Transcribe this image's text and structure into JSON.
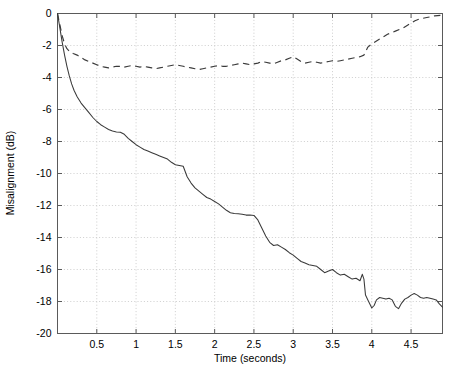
{
  "chart_data": {
    "type": "line",
    "title": "",
    "xlabel": "Time (seconds)",
    "ylabel": "Misalignment (dB)",
    "xlim": [
      0,
      4.9
    ],
    "ylim": [
      -20,
      0
    ],
    "grid": true,
    "legend": "none",
    "xticks": [
      0.5,
      1,
      1.5,
      2,
      2.5,
      3,
      3.5,
      4,
      4.5
    ],
    "xtick_labels": [
      "0.5",
      "1",
      "1.5",
      "2",
      "2.5",
      "3",
      "3.5",
      "4",
      "4.5"
    ],
    "yticks": [
      0,
      -2,
      -4,
      -6,
      -8,
      -10,
      -12,
      -14,
      -16,
      -18,
      -20
    ],
    "ytick_labels": [
      "0",
      "-2",
      "-4",
      "-6",
      "-8",
      "-10",
      "-12",
      "-14",
      "-16",
      "-18",
      "-20"
    ],
    "series": [
      {
        "name": "solid-curve",
        "style": "solid",
        "color": "#3a3a3a",
        "x": [
          0.0,
          0.03,
          0.06,
          0.09,
          0.12,
          0.15,
          0.18,
          0.21,
          0.25,
          0.3,
          0.35,
          0.4,
          0.45,
          0.5,
          0.55,
          0.6,
          0.65,
          0.7,
          0.75,
          0.8,
          0.85,
          0.9,
          0.95,
          1.0,
          1.05,
          1.1,
          1.15,
          1.2,
          1.25,
          1.3,
          1.35,
          1.4,
          1.45,
          1.5,
          1.55,
          1.6,
          1.65,
          1.7,
          1.75,
          1.8,
          1.85,
          1.9,
          1.95,
          2.0,
          2.05,
          2.1,
          2.15,
          2.2,
          2.25,
          2.3,
          2.35,
          2.4,
          2.45,
          2.5,
          2.55,
          2.6,
          2.65,
          2.7,
          2.75,
          2.8,
          2.85,
          2.9,
          2.95,
          3.0,
          3.05,
          3.1,
          3.15,
          3.2,
          3.25,
          3.3,
          3.35,
          3.4,
          3.45,
          3.5,
          3.55,
          3.6,
          3.65,
          3.7,
          3.75,
          3.8,
          3.85,
          3.88,
          3.9,
          3.92,
          3.95,
          3.98,
          4.0,
          4.03,
          4.06,
          4.1,
          4.14,
          4.18,
          4.22,
          4.26,
          4.3,
          4.34,
          4.38,
          4.42,
          4.46,
          4.5,
          4.54,
          4.58,
          4.62,
          4.66,
          4.7,
          4.74,
          4.78,
          4.82,
          4.86,
          4.9
        ],
        "y": [
          0.0,
          -0.9,
          -1.8,
          -2.6,
          -3.3,
          -3.9,
          -4.4,
          -4.8,
          -5.2,
          -5.6,
          -5.9,
          -6.2,
          -6.5,
          -6.75,
          -6.95,
          -7.1,
          -7.25,
          -7.35,
          -7.4,
          -7.42,
          -7.55,
          -7.8,
          -8.0,
          -8.2,
          -8.35,
          -8.5,
          -8.6,
          -8.7,
          -8.8,
          -8.9,
          -9.0,
          -9.1,
          -9.3,
          -9.45,
          -9.5,
          -9.55,
          -10.2,
          -10.6,
          -10.9,
          -11.1,
          -11.3,
          -11.5,
          -11.6,
          -11.75,
          -11.9,
          -12.1,
          -12.3,
          -12.45,
          -12.5,
          -12.52,
          -12.55,
          -12.6,
          -12.6,
          -12.62,
          -12.9,
          -13.4,
          -13.9,
          -14.3,
          -14.5,
          -14.45,
          -14.6,
          -14.75,
          -14.95,
          -15.1,
          -15.3,
          -15.5,
          -15.6,
          -15.7,
          -15.75,
          -15.8,
          -16.0,
          -16.2,
          -16.1,
          -16.0,
          -16.2,
          -16.35,
          -16.3,
          -16.45,
          -16.6,
          -16.55,
          -16.7,
          -16.3,
          -16.6,
          -17.6,
          -17.9,
          -18.2,
          -18.4,
          -18.25,
          -17.9,
          -17.75,
          -17.8,
          -17.85,
          -17.8,
          -17.9,
          -18.3,
          -18.45,
          -18.1,
          -17.85,
          -17.75,
          -17.6,
          -17.5,
          -17.6,
          -17.75,
          -17.8,
          -17.75,
          -17.8,
          -17.85,
          -17.9,
          -18.15,
          -18.35
        ]
      },
      {
        "name": "dashed-curve",
        "style": "dashed",
        "color": "#3a3a3a",
        "x": [
          0.0,
          0.03,
          0.06,
          0.09,
          0.12,
          0.16,
          0.2,
          0.25,
          0.3,
          0.35,
          0.4,
          0.45,
          0.5,
          0.55,
          0.6,
          0.65,
          0.7,
          0.75,
          0.8,
          0.85,
          0.9,
          0.95,
          1.0,
          1.05,
          1.1,
          1.15,
          1.2,
          1.25,
          1.3,
          1.35,
          1.4,
          1.45,
          1.5,
          1.55,
          1.6,
          1.65,
          1.7,
          1.75,
          1.8,
          1.85,
          1.9,
          1.95,
          2.0,
          2.05,
          2.1,
          2.15,
          2.2,
          2.25,
          2.3,
          2.35,
          2.4,
          2.45,
          2.5,
          2.55,
          2.6,
          2.65,
          2.7,
          2.75,
          2.8,
          2.85,
          2.9,
          2.95,
          3.0,
          3.05,
          3.1,
          3.15,
          3.2,
          3.25,
          3.3,
          3.35,
          3.4,
          3.45,
          3.5,
          3.55,
          3.6,
          3.65,
          3.7,
          3.75,
          3.8,
          3.85,
          3.9,
          3.95,
          4.0,
          4.05,
          4.1,
          4.15,
          4.2,
          4.25,
          4.3,
          4.35,
          4.4,
          4.45,
          4.5,
          4.55,
          4.6,
          4.65,
          4.7,
          4.8,
          4.9
        ],
        "y": [
          0.0,
          -0.7,
          -1.4,
          -1.9,
          -2.2,
          -2.4,
          -2.5,
          -2.6,
          -2.75,
          -2.9,
          -3.0,
          -3.1,
          -3.2,
          -3.3,
          -3.35,
          -3.4,
          -3.35,
          -3.3,
          -3.3,
          -3.35,
          -3.3,
          -3.25,
          -3.3,
          -3.35,
          -3.3,
          -3.35,
          -3.4,
          -3.45,
          -3.4,
          -3.35,
          -3.3,
          -3.25,
          -3.2,
          -3.25,
          -3.3,
          -3.35,
          -3.4,
          -3.45,
          -3.5,
          -3.45,
          -3.4,
          -3.35,
          -3.3,
          -3.25,
          -3.3,
          -3.3,
          -3.25,
          -3.2,
          -3.15,
          -3.1,
          -3.15,
          -3.2,
          -3.15,
          -3.1,
          -3.0,
          -3.05,
          -3.1,
          -3.15,
          -3.05,
          -2.95,
          -2.9,
          -2.8,
          -2.7,
          -2.85,
          -3.0,
          -3.1,
          -3.05,
          -3.0,
          -3.05,
          -3.1,
          -3.05,
          -3.0,
          -2.95,
          -3.0,
          -2.95,
          -2.9,
          -2.85,
          -2.8,
          -2.75,
          -2.7,
          -2.6,
          -2.1,
          -1.9,
          -1.75,
          -1.6,
          -1.45,
          -1.3,
          -1.2,
          -1.1,
          -1.0,
          -0.9,
          -0.75,
          -0.6,
          -0.45,
          -0.35,
          -0.3,
          -0.25,
          -0.15,
          -0.1
        ]
      }
    ]
  },
  "axes": {
    "x_label": "Time (seconds)",
    "y_label": "Misalignment (dB)"
  }
}
